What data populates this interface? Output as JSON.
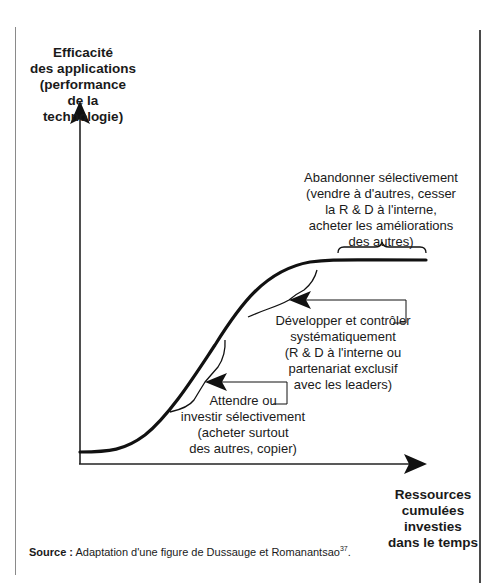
{
  "diagram": {
    "y_axis": {
      "label": "Efficacité\ndes applications\n(performance\nde la technologie)"
    },
    "x_axis": {
      "label": "Ressources\ncumulées\ninvesties\ndans le temps"
    },
    "annotations": [
      {
        "id": "abandon",
        "text": "Abandonner sélectivement\n(vendre à d'autres, cesser\nla R & D à l'interne,\nacheter les améliorations\ndes autres)",
        "curve_region": "plateau"
      },
      {
        "id": "develop",
        "text": "Développer et contrôler\nsystématiquement\n(R & D à l'interne ou\npartenariat exclusif\navec les leaders)",
        "curve_region": "upper growth"
      },
      {
        "id": "wait",
        "text": "Attendre ou\ninvestir sélectivement\n(acheter surtout\ndes autres, copier)",
        "curve_region": "lower growth"
      }
    ],
    "colors": {
      "line": "#111111",
      "text": "#1a1a1a",
      "frame": "#4a4a4a"
    }
  },
  "source": {
    "prefix": "Source :",
    "text": " Adaptation d'une figure de Dussauge et Romanantsao",
    "footnote": "37",
    "suffix": "."
  }
}
